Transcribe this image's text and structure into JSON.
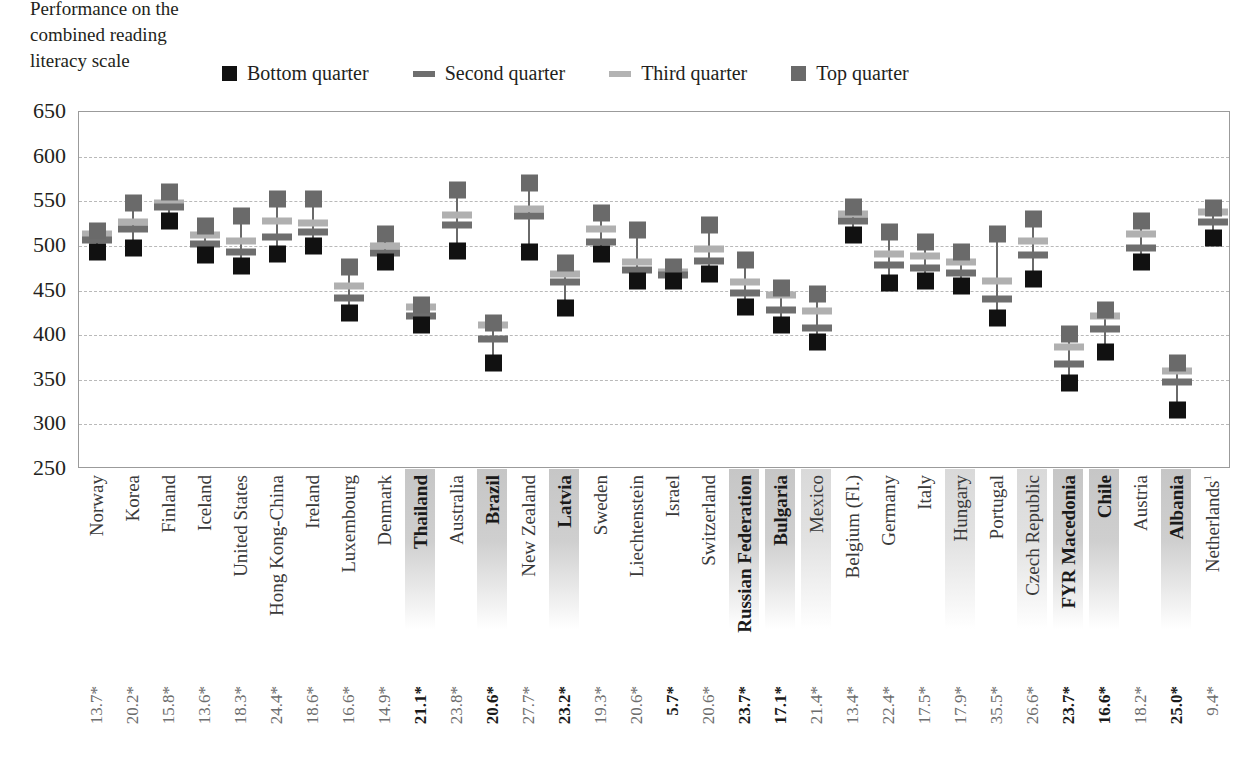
{
  "caption": {
    "line1": "Performance on the",
    "line2": "combined reading",
    "line3": "literacy scale"
  },
  "legend": {
    "items": [
      {
        "label": "Bottom quarter",
        "swatch": "square-black-icon",
        "color": "#111111"
      },
      {
        "label": "Second quarter",
        "swatch": "bar-dark-gray-icon",
        "color": "#6e6e6e"
      },
      {
        "label": "Third quarter",
        "swatch": "bar-light-gray-icon",
        "color": "#b0b0b0"
      },
      {
        "label": "Top quarter",
        "swatch": "square-gray-icon",
        "color": "#6a6a6a"
      }
    ]
  },
  "chart_data": {
    "type": "scatter",
    "title": "Performance on the combined reading literacy scale",
    "xlabel": "",
    "ylabel": "Performance on the combined reading literacy scale",
    "ylim": [
      250,
      650
    ],
    "yticks": [
      250,
      300,
      350,
      400,
      450,
      500,
      550,
      600,
      650
    ],
    "grid": true,
    "legend_position": "top",
    "categories": [
      "Norway",
      "Korea",
      "Finland",
      "Iceland",
      "United States",
      "Hong Kong-China",
      "Ireland",
      "Luxembourg",
      "Denmark",
      "Thailand",
      "Australia",
      "Brazil",
      "New Zealand",
      "Latvia",
      "Sweden",
      "Liechtenstein",
      "Israel",
      "Switzerland",
      "Russian Federation",
      "Bulgaria",
      "Mexico",
      "Belgium (Fl.)",
      "Germany",
      "Italy",
      "Hungary",
      "Portugal",
      "Czech Republic",
      "FYR Macedonia",
      "Chile",
      "Austria",
      "Albania",
      "Netherlands"
    ],
    "category_highlight": [
      "none",
      "none",
      "none",
      "none",
      "none",
      "none",
      "none",
      "none",
      "none",
      "strong",
      "none",
      "strong",
      "none",
      "strong",
      "none",
      "none",
      "none",
      "none",
      "strong",
      "strong",
      "light",
      "none",
      "none",
      "none",
      "light",
      "none",
      "light",
      "strong",
      "strong",
      "none",
      "strong",
      "none"
    ],
    "category_superscript": {
      "Netherlands": "1"
    },
    "series": [
      {
        "name": "Bottom quarter",
        "values": [
          493,
          498,
          528,
          490,
          477,
          491,
          500,
          425,
          482,
          411,
          494,
          369,
          493,
          430,
          491,
          461,
          461,
          469,
          432,
          411,
          392,
          512,
          458,
          461,
          455,
          419,
          463,
          346,
          381,
          482,
          316,
          509
        ]
      },
      {
        "name": "Second quarter",
        "values": [
          507,
          519,
          543,
          502,
          493,
          510,
          516,
          442,
          492,
          421,
          523,
          396,
          533,
          459,
          504,
          473,
          467,
          483,
          447,
          428,
          408,
          528,
          479,
          475,
          470,
          441,
          490,
          368,
          407,
          498,
          348,
          527
        ]
      },
      {
        "name": "Third quarter",
        "values": [
          513,
          527,
          548,
          512,
          505,
          528,
          526,
          455,
          500,
          431,
          535,
          411,
          541,
          469,
          519,
          482,
          471,
          497,
          460,
          445,
          427,
          536,
          491,
          489,
          482,
          461,
          505,
          387,
          421,
          513,
          360,
          538
        ]
      },
      {
        "name": "Top quarter",
        "values": [
          517,
          548,
          560,
          522,
          533,
          552,
          553,
          476,
          513,
          434,
          563,
          414,
          570,
          481,
          537,
          518,
          476,
          523,
          484,
          453,
          446,
          543,
          516,
          504,
          493,
          513,
          530,
          401,
          428,
          528,
          369,
          542
        ]
      }
    ],
    "bottom_values": {
      "label": "",
      "values": [
        "13.7*",
        "20.2*",
        "15.8*",
        "13.6*",
        "18.3*",
        "24.4*",
        "18.6*",
        "16.6*",
        "14.9*",
        "21.1*",
        "23.8*",
        "20.6*",
        "27.7*",
        "23.2*",
        "19.3*",
        "20.6*",
        "5.7*",
        "20.6*",
        "23.7*",
        "17.1*",
        "21.4*",
        "13.4*",
        "22.4*",
        "17.5*",
        "17.9*",
        "35.5*",
        "26.6*",
        "23.7*",
        "16.6*",
        "18.2*",
        "25.0*",
        "9.4*"
      ],
      "bold_flags": [
        false,
        false,
        false,
        false,
        false,
        false,
        false,
        false,
        false,
        true,
        false,
        true,
        false,
        true,
        false,
        false,
        true,
        false,
        true,
        true,
        false,
        false,
        false,
        false,
        false,
        false,
        false,
        true,
        true,
        false,
        true,
        false
      ]
    }
  },
  "colors": {
    "bottom_quarter": "#111111",
    "second_quarter": "#6e6e6e",
    "third_quarter": "#b0b0b0",
    "top_quarter": "#6a6a6a",
    "gridline": "#b9b9b9",
    "frame": "#9b9b9b",
    "axis_text": "#231f20",
    "pct_text": "#6d6d6d"
  }
}
